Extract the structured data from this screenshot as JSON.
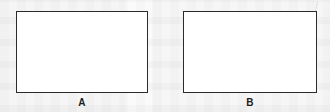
{
  "figure": {
    "width": 330,
    "height": 112,
    "background_color": "#fafafa",
    "stroke_color": "#2b2b2b",
    "fill_color": "#ffffff",
    "label_color": "#1c1c1c"
  },
  "panels": [
    {
      "id": "panel-a",
      "label": "A",
      "x": 16,
      "y": 11,
      "width": 132,
      "height": 82,
      "label_x": 82,
      "label_y": 98
    },
    {
      "id": "panel-b",
      "label": "B",
      "x": 183,
      "y": 11,
      "width": 134,
      "height": 82,
      "label_x": 250,
      "label_y": 98
    }
  ]
}
